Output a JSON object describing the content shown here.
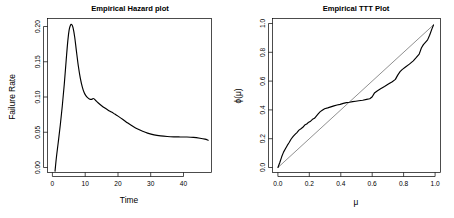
{
  "figure": {
    "width": 454,
    "height": 218,
    "background": "#ffffff",
    "foreground": "#000000",
    "reference_line_color": "#606060"
  },
  "chart_data": [
    {
      "type": "line",
      "panel": "left",
      "title": "Empirical Hazard plot",
      "xlabel": "Time",
      "ylabel": "Failure Rate",
      "xlim": [
        -1.5,
        48.5
      ],
      "ylim": [
        -0.016,
        0.214
      ],
      "xticks": [
        0,
        10,
        20,
        30,
        40
      ],
      "xticklabels": [
        "0",
        "10",
        "20",
        "30",
        "40"
      ],
      "yticks": [
        0.0,
        0.05,
        0.1,
        0.15,
        0.2
      ],
      "yticklabels": [
        "0.00",
        "0.05",
        "0.10",
        "0.15",
        "0.20"
      ],
      "grid": false,
      "legend": null,
      "series": [
        {
          "name": "hazard",
          "x": [
            0.8,
            1.2,
            1.8,
            2.4,
            3.0,
            3.6,
            4.2,
            4.7,
            5.1,
            5.5,
            5.9,
            6.3,
            6.8,
            7.3,
            7.9,
            8.5,
            9.1,
            9.7,
            10.3,
            10.9,
            11.4,
            11.9,
            12.4,
            12.7,
            13.2,
            14.0,
            15.0,
            16.0,
            17.0,
            18.0,
            19.0,
            20.0,
            21.5,
            23.0,
            24.5,
            26.0,
            27.5,
            29.0,
            31.0,
            33.0,
            35.0,
            37.0,
            39.0,
            41.0,
            43.0,
            45.0,
            46.5,
            47.5
          ],
          "y": [
            -0.014,
            0.006,
            0.03,
            0.055,
            0.083,
            0.115,
            0.152,
            0.181,
            0.197,
            0.204,
            0.205,
            0.2,
            0.186,
            0.166,
            0.143,
            0.125,
            0.112,
            0.103,
            0.098,
            0.095,
            0.0935,
            0.0932,
            0.0945,
            0.094,
            0.0915,
            0.0878,
            0.0838,
            0.0802,
            0.077,
            0.0742,
            0.0712,
            0.0682,
            0.0632,
            0.0578,
            0.053,
            0.0488,
            0.0455,
            0.0428,
            0.0402,
            0.0387,
            0.0378,
            0.0373,
            0.0371,
            0.037,
            0.0365,
            0.0352,
            0.0338,
            0.0322
          ]
        }
      ]
    },
    {
      "type": "line",
      "panel": "right",
      "title": "Empirical TTT Plot",
      "xlabel": "μ",
      "ylabel": "ϕ(μ)",
      "xlim": [
        -0.035,
        1.045
      ],
      "ylim": [
        -0.035,
        1.045
      ],
      "xticks": [
        0.0,
        0.2,
        0.4,
        0.6,
        0.8,
        1.0
      ],
      "xticklabels": [
        "0.0",
        "0.2",
        "0.4",
        "0.6",
        "0.8",
        "1.0"
      ],
      "yticks": [
        0.0,
        0.2,
        0.4,
        0.6,
        0.8,
        1.0
      ],
      "yticklabels": [
        "0.0",
        "0.2",
        "0.4",
        "0.6",
        "0.8",
        "1.0"
      ],
      "grid": false,
      "legend": null,
      "series": [
        {
          "name": "ttt-curve",
          "x": [
            0.0,
            0.012,
            0.024,
            0.036,
            0.048,
            0.06,
            0.072,
            0.085,
            0.098,
            0.11,
            0.122,
            0.135,
            0.148,
            0.16,
            0.172,
            0.185,
            0.198,
            0.21,
            0.222,
            0.235,
            0.248,
            0.26,
            0.272,
            0.285,
            0.3,
            0.32,
            0.34,
            0.36,
            0.38,
            0.4,
            0.42,
            0.44,
            0.46,
            0.48,
            0.5,
            0.52,
            0.545,
            0.57,
            0.59,
            0.605,
            0.62,
            0.64,
            0.66,
            0.685,
            0.71,
            0.735,
            0.755,
            0.77,
            0.785,
            0.8,
            0.82,
            0.845,
            0.87,
            0.89,
            0.908,
            0.922,
            0.935,
            0.948,
            0.962,
            0.975,
            0.99,
            1.0
          ],
          "y": [
            0.0,
            0.035,
            0.075,
            0.108,
            0.132,
            0.155,
            0.175,
            0.2,
            0.218,
            0.232,
            0.245,
            0.262,
            0.272,
            0.282,
            0.298,
            0.305,
            0.318,
            0.325,
            0.338,
            0.345,
            0.362,
            0.378,
            0.392,
            0.402,
            0.412,
            0.418,
            0.425,
            0.432,
            0.438,
            0.443,
            0.45,
            0.455,
            0.458,
            0.462,
            0.465,
            0.468,
            0.472,
            0.478,
            0.482,
            0.495,
            0.522,
            0.538,
            0.552,
            0.568,
            0.585,
            0.602,
            0.618,
            0.648,
            0.672,
            0.688,
            0.705,
            0.725,
            0.748,
            0.772,
            0.795,
            0.838,
            0.862,
            0.878,
            0.895,
            0.928,
            0.972,
            1.0
          ]
        },
        {
          "name": "reference-diagonal",
          "x": [
            0.0,
            1.0
          ],
          "y": [
            0.0,
            1.0
          ]
        }
      ]
    }
  ]
}
